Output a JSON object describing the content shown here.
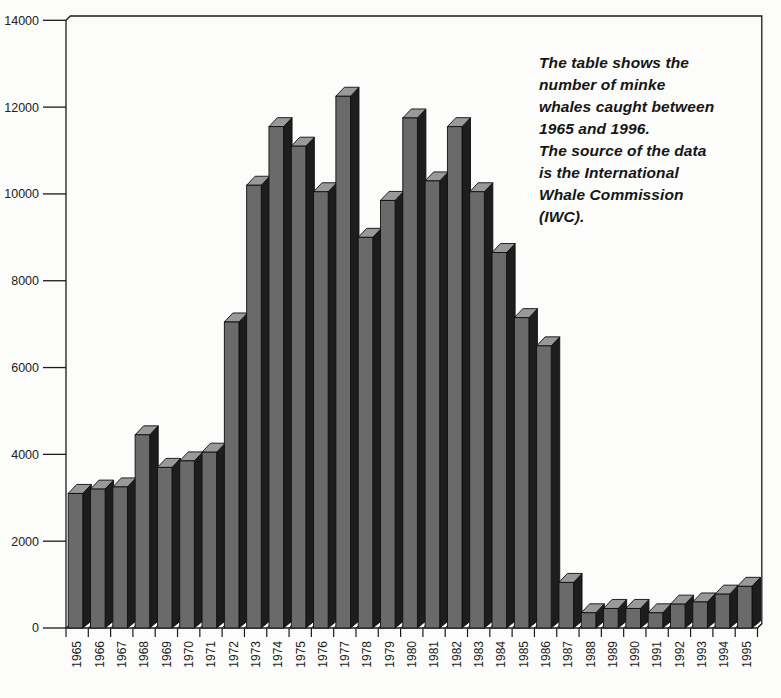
{
  "annotation": {
    "full_text": "The table shows the number of minke whales caught between 1965 and 1996. The source of the data is the International Whale Commission (IWC).",
    "lines": [
      "The table shows the",
      "number of minke",
      "whales caught between",
      "1965 and 1996.",
      "The source of the data",
      "is the International",
      "Whale Commission",
      "(IWC)."
    ]
  },
  "chart_data": {
    "type": "bar",
    "title": "",
    "xlabel": "",
    "ylabel": "",
    "categories": [
      "1965",
      "1966",
      "1967",
      "1968",
      "1969",
      "1970",
      "1971",
      "1972",
      "1973",
      "1974",
      "1975",
      "1976",
      "1977",
      "1978",
      "1979",
      "1980",
      "1981",
      "1982",
      "1983",
      "1984",
      "1985",
      "1986",
      "1987",
      "1988",
      "1989",
      "1990",
      "1991",
      "1992",
      "1993",
      "1994",
      "1995"
    ],
    "values": [
      3100,
      3200,
      3250,
      4450,
      3700,
      3850,
      4050,
      7050,
      10200,
      11550,
      11100,
      10050,
      12250,
      9000,
      9850,
      11750,
      10300,
      11550,
      10050,
      8650,
      7150,
      6500,
      1050,
      350,
      450,
      450,
      350,
      550,
      600,
      780,
      960
    ],
    "ylim": [
      0,
      14000
    ],
    "yticks": [
      0,
      2000,
      4000,
      6000,
      8000,
      10000,
      12000,
      14000
    ],
    "grid": false,
    "legend": "none",
    "bar_style": "3d",
    "x_tick_label_rotation": 90,
    "annotation": "The table shows the number of minke whales caught between 1965 and 1996. The source of the data is the International Whale Commission (IWC).",
    "colors": {
      "bar_front": "#6a6a6a",
      "bar_side": "#1d1d1d",
      "bar_top": "#999999",
      "outline": "#0f0f0f",
      "axis": "#1a1a1a",
      "text": "#222222",
      "background": "#fcfcfa"
    }
  }
}
